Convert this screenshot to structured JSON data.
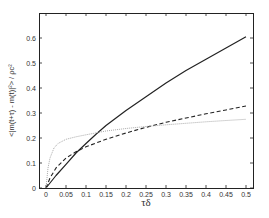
{
  "chart_data": {
    "type": "line",
    "title": "",
    "xlabel": "τδ",
    "ylabel": "<|m(t+τ) - m(t)|²> / ρc²",
    "xlim": [
      -0.02,
      0.52
    ],
    "ylim": [
      0,
      0.7
    ],
    "xticks": [
      0,
      0.05,
      0.1,
      0.15,
      0.2,
      0.25,
      0.3,
      0.35,
      0.4,
      0.45,
      0.5
    ],
    "xtick_labels": [
      "0",
      "0.05",
      "0.1",
      "0.15",
      "0.2",
      "0.25",
      "0.3",
      "0.35",
      "0.4",
      "0.45",
      "0.5"
    ],
    "yticks": [
      0,
      0.1,
      0.2,
      0.3,
      0.4,
      0.5,
      0.6
    ],
    "ytick_labels": [
      "0",
      "0.1",
      "0.2",
      "0.3",
      "0.4",
      "0.5",
      "0.6"
    ],
    "grid": false,
    "legend": null,
    "series": [
      {
        "name": "solid",
        "style": "solid",
        "color": "#222222",
        "x": [
          0,
          0.025,
          0.05,
          0.075,
          0.1,
          0.125,
          0.15,
          0.2,
          0.25,
          0.3,
          0.35,
          0.4,
          0.45,
          0.5
        ],
        "y": [
          0,
          0.05,
          0.095,
          0.14,
          0.178,
          0.215,
          0.25,
          0.31,
          0.365,
          0.42,
          0.47,
          0.515,
          0.56,
          0.605
        ]
      },
      {
        "name": "dashed",
        "style": "dashed",
        "color": "#222222",
        "x": [
          0,
          0.01,
          0.025,
          0.05,
          0.075,
          0.1,
          0.15,
          0.2,
          0.25,
          0.3,
          0.35,
          0.4,
          0.45,
          0.5
        ],
        "y": [
          0,
          0.04,
          0.08,
          0.12,
          0.145,
          0.165,
          0.195,
          0.22,
          0.243,
          0.263,
          0.28,
          0.297,
          0.312,
          0.328
        ]
      },
      {
        "name": "dotted",
        "style": "dotted",
        "color": "#aaaaaa",
        "x": [
          0,
          0.005,
          0.01,
          0.02,
          0.03,
          0.05,
          0.075,
          0.1,
          0.15,
          0.2,
          0.25,
          0.3,
          0.35,
          0.4,
          0.45,
          0.5
        ],
        "y": [
          0,
          0.08,
          0.12,
          0.16,
          0.178,
          0.195,
          0.205,
          0.213,
          0.228,
          0.238,
          0.246,
          0.253,
          0.259,
          0.265,
          0.27,
          0.275
        ]
      }
    ]
  },
  "layout": {
    "plot_left": 39,
    "plot_top": 13,
    "plot_right": 253,
    "plot_bottom": 188,
    "x0_px": 46,
    "x_scale": 400,
    "y0_px": 188,
    "y_scale": 250
  }
}
